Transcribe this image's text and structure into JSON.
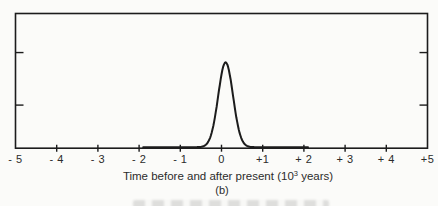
{
  "page": {
    "background": "#fbfbf9",
    "text_color": "#2b2b2b"
  },
  "chart_data": {
    "type": "line",
    "title": "",
    "xlabel": "Time before and after present (10³ years)",
    "xlabel_parts": {
      "prefix": "Time before and after present (10",
      "exponent": "3",
      "suffix": " years)"
    },
    "panel_label": "(b)",
    "xlim": [
      -5,
      5
    ],
    "x_tick_values": [
      -5,
      -4,
      -3,
      -2,
      -1,
      0,
      1,
      2,
      3,
      4,
      5
    ],
    "x_tick_labels": [
      "- 5",
      "- 4",
      "- 3",
      "- 2",
      "- 1",
      "0",
      "+1",
      "+ 2",
      "+ 3",
      "+ 4",
      "+5"
    ],
    "ylim": [
      0,
      1
    ],
    "y_axis_tick_fractions_from_top": [
      0.29,
      0.68
    ],
    "grid": false,
    "legend": false,
    "line_color": "#1c1c1c",
    "series": [
      {
        "name": "spike",
        "model": "gaussian",
        "center": 0.1,
        "sigma": 0.18,
        "peak": 0.63,
        "x": [
          -5,
          -2,
          -1,
          -0.7,
          -0.5,
          -0.4,
          -0.3,
          -0.2,
          -0.1,
          0,
          0.1,
          0.2,
          0.3,
          0.4,
          0.5,
          0.6,
          0.7,
          0.8,
          1,
          2,
          5
        ],
        "y": [
          0,
          0,
          0,
          0,
          0.002,
          0.013,
          0.053,
          0.157,
          0.34,
          0.54,
          0.63,
          0.54,
          0.34,
          0.157,
          0.053,
          0.013,
          0.002,
          0,
          0,
          0,
          0
        ]
      }
    ]
  }
}
